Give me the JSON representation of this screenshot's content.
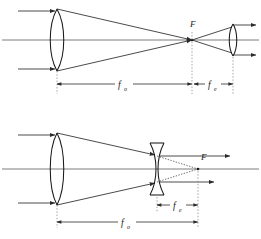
{
  "figure": {
    "background_color": "#ffffff",
    "ray_color": "#2b2b2b",
    "axis_color": "#6e6e6e",
    "lens_color": "#1a1a1a",
    "virtual_ray_color": "#4a4a4a",
    "guide_color": "#8a8a8a"
  },
  "diagrams": [
    {
      "id": "keplerian",
      "name": "Keplerian telescope",
      "objective_type": "biconvex",
      "eyepiece_type": "biconvex",
      "focal_point_label": "F",
      "dimensions": [
        {
          "id": "f-o-top",
          "symbol": "f",
          "subscript": "o",
          "meaning": "objective focal length"
        },
        {
          "id": "f-e-top",
          "symbol": "f",
          "subscript": "e",
          "meaning": "eyepiece focal length"
        }
      ]
    },
    {
      "id": "galilean",
      "name": "Galilean telescope",
      "objective_type": "biconvex",
      "eyepiece_type": "biconcave",
      "focal_point_label": "F",
      "dimensions": [
        {
          "id": "f-o-bottom",
          "symbol": "f",
          "subscript": "o",
          "meaning": "objective focal length"
        },
        {
          "id": "f-e-bottom",
          "symbol": "f",
          "subscript": "e",
          "meaning": "eyepiece focal length"
        }
      ]
    }
  ],
  "labels": {
    "f_symbol": "f",
    "sub_o": "o",
    "sub_e": "e",
    "focal_point": "F"
  }
}
